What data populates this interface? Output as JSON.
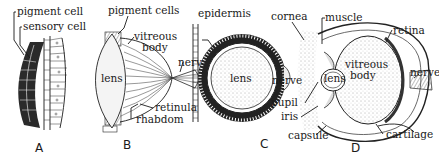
{
  "figures": [
    {
      "id": "A",
      "caption": "A",
      "labels": {
        "pigment_cell": "pigment cell",
        "sensory_cell": "sensory cell"
      }
    },
    {
      "id": "B",
      "caption": "B",
      "labels": {
        "pigment_cells": "pigment cells",
        "vitreous": "vitreous",
        "body": "body",
        "lens": "lens",
        "nerve": "nerve",
        "retinula": "retinula",
        "rhabdom": "rhabdom"
      }
    },
    {
      "id": "C",
      "caption": "C",
      "labels": {
        "epidermis": "epidermis",
        "lens": "lens",
        "nerve": "nerve"
      }
    },
    {
      "id": "D",
      "caption": "D",
      "labels": {
        "cornea": "cornea",
        "muscle": "muscle",
        "retina": "retina",
        "lens": "lens",
        "vitreous": "vitreous",
        "body": "body",
        "nerve": "nerve",
        "pupil": "pupil",
        "iris": "iris",
        "capsule": "capsule",
        "cartilage": "cartilage"
      }
    }
  ]
}
